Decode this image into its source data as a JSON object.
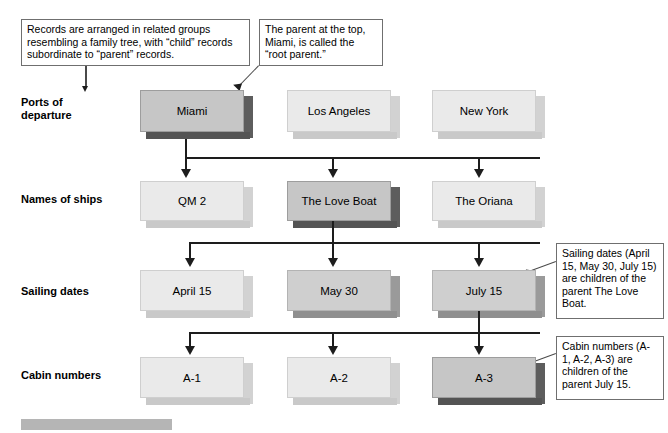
{
  "diagram": {
    "notes": [
      {
        "id": "note-family-tree",
        "text": "Records are arranged in related groups resembling a family tree, with “child” records subordinate to “parent” records."
      },
      {
        "id": "note-root-parent",
        "text": "The parent at the top, Miami, is called the “root parent.”"
      },
      {
        "id": "note-sailing-children",
        "text": "Sailing dates (April 15, May 30, July 15) are children of the parent The Love Boat."
      },
      {
        "id": "note-cabin-children",
        "text": "Cabin numbers (A-1, A-2, A-3) are children of the parent July 15."
      }
    ],
    "rows": [
      {
        "id": "row-ports",
        "label": "Ports of\ndeparture",
        "nodes": [
          {
            "id": "node-miami",
            "label": "Miami",
            "style": "dark"
          },
          {
            "id": "node-los-angeles",
            "label": "Los Angeles",
            "style": "light"
          },
          {
            "id": "node-new-york",
            "label": "New York",
            "style": "light"
          }
        ]
      },
      {
        "id": "row-ships",
        "label": "Names of ships",
        "nodes": [
          {
            "id": "node-qm2",
            "label": "QM 2",
            "style": "light"
          },
          {
            "id": "node-love-boat",
            "label": "The Love Boat",
            "style": "dark"
          },
          {
            "id": "node-oriana",
            "label": "The Oriana",
            "style": "light"
          }
        ]
      },
      {
        "id": "row-sailing-dates",
        "label": "Sailing dates",
        "nodes": [
          {
            "id": "node-april-15",
            "label": "April 15",
            "style": "light"
          },
          {
            "id": "node-may-30",
            "label": "May 30",
            "style": "med"
          },
          {
            "id": "node-july-15",
            "label": "July 15",
            "style": "med"
          }
        ]
      },
      {
        "id": "row-cabin-numbers",
        "label": "Cabin numbers",
        "nodes": [
          {
            "id": "node-a1",
            "label": "A-1",
            "style": "light"
          },
          {
            "id": "node-a2",
            "label": "A-2",
            "style": "light"
          },
          {
            "id": "node-a3",
            "label": "A-3",
            "style": "dark"
          }
        ]
      }
    ],
    "colors": {
      "line": "#1d1d1d",
      "note_border": "#6f6f6f",
      "box_light": "#eaeaea",
      "box_medium": "#cfcfcf",
      "box_dark_shadow": "#5d5d5d",
      "footer_bar": "#b5b5b5"
    }
  }
}
